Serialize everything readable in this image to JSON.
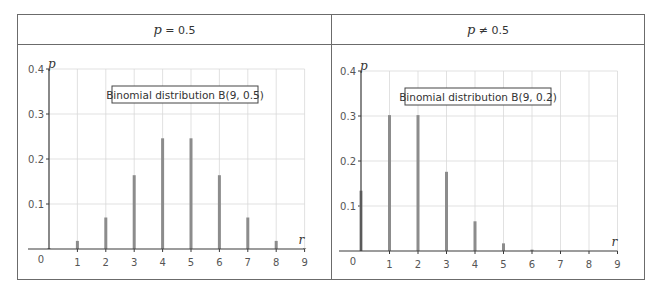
{
  "panels": [
    {
      "header": {
        "var": "p",
        "relation": " = 0.5"
      },
      "legend": "Binomial distribution B(9, 0.5)"
    },
    {
      "header": {
        "var": "p",
        "relation": " ≠ 0.5"
      },
      "legend": "Binomial distribution B(9, 0.2)"
    }
  ],
  "colors": {
    "bar": "#8c8c8c",
    "axis": "#3a3a3a",
    "grid": "#d9d9d9",
    "frame": "#6b6b6b"
  },
  "chart_data": [
    {
      "type": "bar",
      "title": "Binomial distribution B(9, 0.5)",
      "xlabel": "r",
      "ylabel": "p",
      "categories": [
        0,
        1,
        2,
        3,
        4,
        5,
        6,
        7,
        8,
        9
      ],
      "values": [
        0.002,
        0.018,
        0.07,
        0.164,
        0.246,
        0.246,
        0.164,
        0.07,
        0.018,
        0.002
      ],
      "xticks": [
        "0",
        "1",
        "2",
        "3",
        "4",
        "5",
        "6",
        "7",
        "8",
        "9"
      ],
      "yticks": [
        "0.1",
        "0.2",
        "0.3",
        "0.4"
      ],
      "ylim": [
        0,
        0.4
      ],
      "xlim": [
        0,
        9
      ],
      "grid": true
    },
    {
      "type": "bar",
      "title": "Binomial distribution B(9, 0.2)",
      "xlabel": "r",
      "ylabel": "p",
      "categories": [
        0,
        1,
        2,
        3,
        4,
        5,
        6,
        7,
        8,
        9
      ],
      "values": [
        0.134,
        0.302,
        0.302,
        0.176,
        0.066,
        0.017,
        0.003,
        0.0003,
        2e-05,
        5e-07
      ],
      "xticks": [
        "0",
        "1",
        "2",
        "3",
        "4",
        "5",
        "6",
        "7",
        "8",
        "9"
      ],
      "yticks": [
        "0.1",
        "0.2",
        "0.3",
        "0.4"
      ],
      "ylim": [
        0,
        0.4
      ],
      "xlim": [
        0,
        9
      ],
      "grid": true
    }
  ]
}
